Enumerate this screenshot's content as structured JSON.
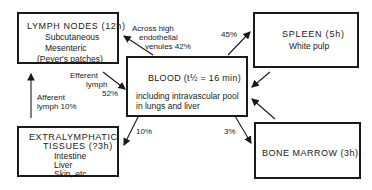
{
  "diagram": {
    "nodes": {
      "lymph_nodes": {
        "title": "LYMPH NODES (12h)",
        "lines": [
          "Subcutaneous",
          "Mesenteric",
          "(Peyer's patches)"
        ]
      },
      "blood": {
        "title": "BLOOD (t½ = 16 min)",
        "lines": [
          "including intravascular pool",
          "in lungs and liver"
        ]
      },
      "spleen": {
        "title": "SPLEEN (5h)",
        "lines": [
          "White pulp"
        ]
      },
      "extralymphatic": {
        "title_line1": "EXTRALYMPHATIC",
        "title_line2": "TISSUES (?3h)",
        "lines": [
          "Intestine",
          "Liver",
          "Skin, etc."
        ]
      },
      "bone_marrow": {
        "title": "BONE MARROW (3h)"
      }
    },
    "edges": {
      "blood_to_lymph": {
        "lines": [
          "Across high",
          "endothelial",
          "venules 42%"
        ]
      },
      "blood_to_spleen": {
        "label": "45%"
      },
      "lymph_to_blood": {
        "lines": [
          "Efferent",
          "lymph",
          "52%"
        ]
      },
      "extra_to_lymph": {
        "lines": [
          "Afferent",
          "lymph 10%"
        ]
      },
      "blood_to_extra": {
        "label": "10%"
      },
      "blood_to_marrow": {
        "label": "3%"
      }
    },
    "colors": {
      "ink": "#1a1a1a",
      "background": "#ffffff"
    }
  }
}
